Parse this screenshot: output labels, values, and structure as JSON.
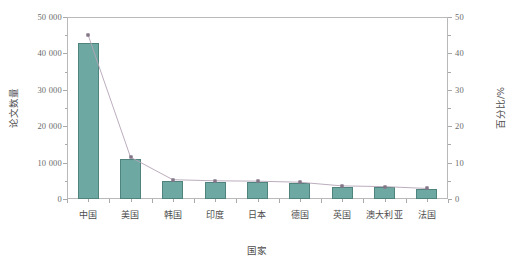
{
  "chart_data": {
    "type": "bar",
    "title": "",
    "subtitle": "",
    "xlabel": "国家",
    "ylabel": "论文数量",
    "y2label": "百分比/%",
    "categories": [
      "中国",
      "美国",
      "韩国",
      "印度",
      "日本",
      "德国",
      "英国",
      "澳大利亚",
      "法国"
    ],
    "series": [
      {
        "name": "论文数量",
        "type": "bar",
        "axis": "left",
        "values": [
          42800,
          11000,
          5000,
          4800,
          4700,
          4400,
          3400,
          3200,
          2700
        ],
        "color": "#6ea8a2",
        "border_color": "#4e837e"
      },
      {
        "name": "百分比/%",
        "type": "line",
        "axis": "right",
        "values": [
          45.0,
          11.5,
          5.3,
          5.0,
          4.9,
          4.6,
          3.6,
          3.4,
          2.9
        ],
        "color": "#b3a4b5",
        "marker": "square",
        "marker_color": "#9b8b9e"
      }
    ],
    "ylim": [
      0,
      50000
    ],
    "y2lim": [
      0,
      50
    ],
    "yticks": [
      0,
      10000,
      20000,
      30000,
      40000,
      50000
    ],
    "ytick_labels": [
      "0",
      "10 000",
      "20 000",
      "30 000",
      "40 000",
      "50 000"
    ],
    "y2ticks": [
      0,
      10,
      20,
      30,
      40,
      50
    ],
    "y2tick_labels": [
      "0",
      "10",
      "20",
      "30",
      "40",
      "50"
    ],
    "grid": false,
    "legend": "none",
    "background": "#ffffff",
    "frame_color": "#b9b9b9"
  }
}
